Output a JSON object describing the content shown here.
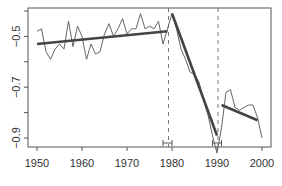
{
  "chart_data": {
    "type": "line",
    "title": "",
    "xlabel": "",
    "ylabel": "",
    "xlim": [
      1948,
      2002.5
    ],
    "ylim": [
      -0.93,
      -0.39
    ],
    "grid": false,
    "legend": null,
    "x_ticks": [
      1950,
      1960,
      1970,
      1980,
      1990,
      2000
    ],
    "x_tick_labels": [
      "1950",
      "1960",
      "1970",
      "1980",
      "1990",
      "2000"
    ],
    "y_ticks": [
      -0.4,
      -0.5,
      -0.6,
      -0.7,
      -0.8,
      -0.9
    ],
    "y_tick_labels": [
      "",
      "-0.5",
      "",
      "-0.7",
      "",
      "-0.9"
    ],
    "series": [
      {
        "name": "observed",
        "style": "thin-line",
        "x": [
          1950,
          1951,
          1952,
          1953,
          1954,
          1955,
          1956,
          1957,
          1958,
          1959,
          1960,
          1961,
          1962,
          1963,
          1964,
          1965,
          1966,
          1967,
          1968,
          1969,
          1970,
          1971,
          1972,
          1973,
          1974,
          1975,
          1976,
          1977,
          1978,
          1979,
          1980,
          1981,
          1982,
          1983,
          1984,
          1985,
          1986,
          1987,
          1988,
          1989,
          1990,
          1991,
          1992,
          1993,
          1994,
          1995,
          1996,
          1997,
          1998,
          1999,
          2000
        ],
        "values": [
          -0.48,
          -0.47,
          -0.56,
          -0.59,
          -0.55,
          -0.53,
          -0.55,
          -0.44,
          -0.54,
          -0.46,
          -0.5,
          -0.59,
          -0.53,
          -0.57,
          -0.56,
          -0.49,
          -0.45,
          -0.5,
          -0.47,
          -0.43,
          -0.49,
          -0.47,
          -0.47,
          -0.41,
          -0.47,
          -0.46,
          -0.47,
          -0.44,
          -0.53,
          -0.47,
          -0.41,
          -0.47,
          -0.55,
          -0.59,
          -0.64,
          -0.65,
          -0.68,
          -0.75,
          -0.81,
          -0.89,
          -0.96,
          -0.86,
          -0.72,
          -0.71,
          -0.78,
          -0.79,
          -0.78,
          -0.77,
          -0.77,
          -0.82,
          -0.9
        ]
      },
      {
        "name": "segment-fit-1",
        "style": "thick-line",
        "x": [
          1950,
          1979
        ],
        "values": [
          -0.53,
          -0.48
        ]
      },
      {
        "name": "segment-fit-2",
        "style": "thick-line",
        "x": [
          1980,
          1990
        ],
        "values": [
          -0.41,
          -0.89
        ]
      },
      {
        "name": "segment-fit-3",
        "style": "thick-line",
        "x": [
          1991,
          1999
        ],
        "values": [
          -0.77,
          -0.83
        ]
      }
    ],
    "breakpoints": [
      {
        "x": 1979,
        "ci": [
          1978,
          1980
        ]
      },
      {
        "x": 1990,
        "ci": [
          1989,
          1991
        ]
      }
    ],
    "annotations": [
      "dashed vertical lines at breakpoints",
      "confidence interval brackets on x-axis"
    ]
  }
}
